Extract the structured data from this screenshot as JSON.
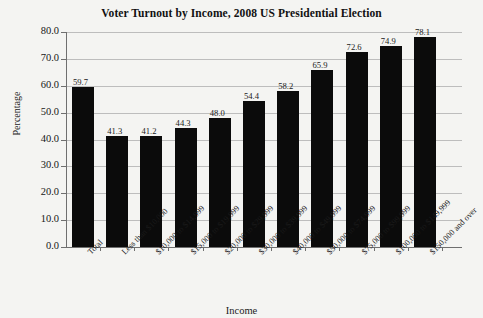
{
  "chart_data": {
    "type": "bar",
    "title": "Voter Turnout by Income, 2008 US Presidential Election",
    "xlabel": "Income",
    "ylabel": "Percentage",
    "ylim": [
      0.0,
      80.0
    ],
    "ytick_labels": [
      "80.0",
      "70.0",
      "60.0",
      "50.0",
      "40.0",
      "30.0",
      "20.0",
      "10.0",
      "0.0"
    ],
    "ytick_values": [
      80.0,
      70.0,
      60.0,
      50.0,
      40.0,
      30.0,
      20.0,
      10.0,
      0.0
    ],
    "grid": "horizontal",
    "legend": "none",
    "bar_color": "#0b0b0b",
    "categories": [
      "Total",
      "Less than $10,000",
      "$10,000 to $14,999",
      "$15,000 to $19,999",
      "$20,000 to $29,999",
      "$30,000 to $39,999",
      "$40,000 to $49,999",
      "$50,000 to $74,999",
      "$75,000 to $99,999",
      "$100,000 to $149,999",
      "$150,000 and over"
    ],
    "values": [
      59.7,
      41.3,
      41.2,
      44.3,
      48.0,
      54.4,
      58.2,
      65.9,
      72.6,
      74.9,
      78.1
    ],
    "value_labels": [
      "59.7",
      "41.3",
      "41.2",
      "44.3",
      "48.0",
      "54.4",
      "58.2",
      "65.9",
      "72.6",
      "74.9",
      "78.1"
    ]
  }
}
